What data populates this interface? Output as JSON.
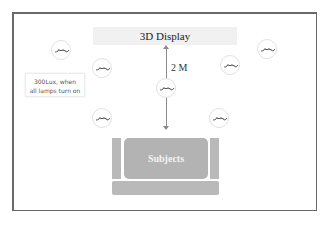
{
  "diagram": {
    "display_label": "3D Display",
    "distance_label": "2 M",
    "callout_text_line1": "300Lux, when",
    "callout_text_line2": "all lamps turn on",
    "subjects_label": "Subjects",
    "lamps": [
      {
        "id": "lamp-1",
        "icon": "lamp-bulb-icon",
        "x": 61,
        "y": 50
      },
      {
        "id": "lamp-2",
        "icon": "lamp-bulb-icon",
        "x": 102,
        "y": 68
      },
      {
        "id": "lamp-3",
        "icon": "lamp-bulb-icon",
        "x": 267,
        "y": 49
      },
      {
        "id": "lamp-4",
        "icon": "lamp-bulb-icon",
        "x": 230,
        "y": 65
      },
      {
        "id": "lamp-5",
        "icon": "lamp-bulb-icon",
        "x": 166,
        "y": 88
      },
      {
        "id": "lamp-6",
        "icon": "lamp-bulb-icon",
        "x": 102,
        "y": 118
      },
      {
        "id": "lamp-7",
        "icon": "lamp-bulb-icon",
        "x": 219,
        "y": 118
      }
    ],
    "colors": {
      "frame": "#6a6a6a",
      "display_bg": "#f1f1f1",
      "seat": "#b9b9b9",
      "subjects_bg": "#b3b3b3",
      "arrow": "#8a8a8a"
    }
  }
}
